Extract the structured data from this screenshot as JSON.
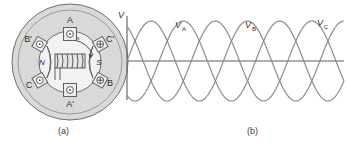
{
  "figure": {
    "caption_a": "(a)",
    "caption_b": "(b)"
  },
  "machine_diagram": {
    "name": "three-phase-stator-cross-section",
    "rotor": {
      "north_pole_label": "N",
      "south_pole_label": "S",
      "speed_label": "ω",
      "speed_subscript": "s"
    },
    "slots": [
      {
        "label": "A",
        "current": "out",
        "symbol": "⊙",
        "angle_deg": 90
      },
      {
        "label": "C'",
        "current": "in",
        "symbol": "⊕",
        "angle_deg": 30
      },
      {
        "label": "B",
        "current": "in",
        "symbol": "⊕",
        "angle_deg": -30
      },
      {
        "label": "A'",
        "current": "out",
        "symbol": "⊙",
        "angle_deg": -90
      },
      {
        "label": "C",
        "current": "out",
        "symbol": "⊙",
        "angle_deg": -150
      },
      {
        "label": "B'",
        "current": "out",
        "symbol": "⊙",
        "angle_deg": 150
      }
    ],
    "colors": {
      "stator_fill": "#d9d9d9",
      "rotor_fill": "#e8e8e8",
      "outline": "#6e6e6e",
      "text": "#2b2b2b"
    }
  },
  "waveform_plot": {
    "axis_label": "V",
    "labels": [
      "V",
      "V",
      "V"
    ],
    "label_subscripts": [
      "A",
      "B",
      "C"
    ]
  },
  "chart_data": {
    "type": "line",
    "title": "",
    "xlabel": "",
    "ylabel": "V",
    "xlim": [
      0,
      2.25
    ],
    "ylim": [
      -1.25,
      1.25
    ],
    "grid": false,
    "legend": "inline-annotations",
    "x_unit": "cycles",
    "series": [
      {
        "name": "V_A",
        "label": "V",
        "subscript": "A",
        "phase_deg": 0,
        "amplitude": 1,
        "cycles": 2.25,
        "label_x": 0.3,
        "color": "#8c8c8c"
      },
      {
        "name": "V_B",
        "label": "V",
        "subscript": "B",
        "phase_deg": -120,
        "amplitude": 1,
        "cycles": 2.25,
        "label_x": 1.03,
        "color": "#8c8c8c"
      },
      {
        "name": "V_C",
        "label": "V",
        "subscript": "C",
        "phase_deg": -240,
        "amplitude": 1,
        "cycles": 2.25,
        "label_x": 1.78,
        "color": "#8c8c8c"
      }
    ]
  }
}
